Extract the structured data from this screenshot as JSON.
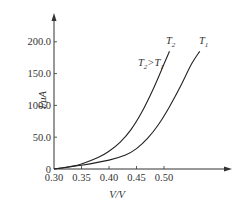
{
  "chart_data": {
    "type": "line",
    "title": "",
    "xlabel": "V/V",
    "ylabel": "I/μA",
    "xlim": [
      0.3,
      0.58
    ],
    "ylim": [
      0,
      220
    ],
    "x_ticks": [
      "0.30",
      "0.35",
      "0.40",
      "0.45",
      "0.50"
    ],
    "y_ticks": [
      "0",
      "50.0",
      "100.0",
      "150.0",
      "200.0"
    ],
    "grid": false,
    "annotation": "T2 > T1",
    "series": [
      {
        "name": "T2",
        "x": [
          0.3,
          0.33,
          0.35,
          0.38,
          0.4,
          0.42,
          0.44,
          0.46,
          0.48,
          0.5,
          0.51
        ],
        "y": [
          0,
          4,
          8,
          18,
          28,
          42,
          62,
          90,
          125,
          165,
          185
        ]
      },
      {
        "name": "T1",
        "x": [
          0.3,
          0.35,
          0.4,
          0.43,
          0.45,
          0.47,
          0.49,
          0.51,
          0.53,
          0.55,
          0.565
        ],
        "y": [
          0,
          6,
          14,
          22,
          32,
          48,
          70,
          98,
          130,
          165,
          185
        ]
      }
    ]
  },
  "labels": {
    "x_axis": "V/V",
    "y_axis": "I/μA",
    "t2": "T",
    "t2_sub": "2",
    "t1": "T",
    "t1_sub": "1",
    "cmp_a": "T",
    "cmp_a_sub": "2",
    "cmp_op": ">",
    "cmp_b": "T",
    "cmp_b_sub": "1"
  }
}
